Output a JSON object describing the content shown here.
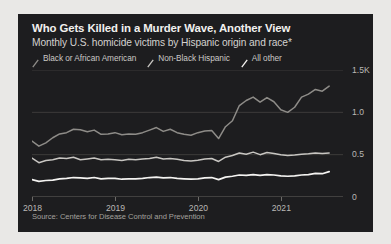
{
  "chart_panel": {
    "title": "Who Gets Killed in a Murder Wave, Another View",
    "subtitle": "Monthly U.S. homicide victims by Hispanic origin and race*",
    "source": "Source: Centers for Disease Control and Prevention",
    "background_color": "#1d1d1f",
    "page_background_color": "#e9e8e6"
  },
  "chart_data": {
    "type": "line",
    "title": "Who Gets Killed in a Murder Wave, Another View",
    "subtitle": "Monthly U.S. homicide victims by Hispanic origin and race*",
    "xlabel": "",
    "ylabel": "",
    "xlim": [
      2018.0,
      2021.75
    ],
    "ylim": [
      0,
      1500
    ],
    "grid": true,
    "legend_position": "top-left",
    "y_ticks": [
      0,
      500,
      1000,
      1500
    ],
    "y_tick_labels": [
      "0",
      "0.5",
      "1.0",
      "1.5K"
    ],
    "x_ticks": [
      2018,
      2019,
      2020,
      2021
    ],
    "x_tick_labels": [
      "2018",
      "2019",
      "2020",
      "2021"
    ],
    "x": [
      2018.0,
      2018.083,
      2018.167,
      2018.25,
      2018.333,
      2018.417,
      2018.5,
      2018.583,
      2018.667,
      2018.75,
      2018.833,
      2018.917,
      2019.0,
      2019.083,
      2019.167,
      2019.25,
      2019.333,
      2019.417,
      2019.5,
      2019.583,
      2019.667,
      2019.75,
      2019.833,
      2019.917,
      2020.0,
      2020.083,
      2020.167,
      2020.25,
      2020.333,
      2020.417,
      2020.5,
      2020.583,
      2020.667,
      2020.75,
      2020.833,
      2020.917,
      2021.0,
      2021.083,
      2021.167,
      2021.25,
      2021.333,
      2021.417,
      2021.5,
      2021.583
    ],
    "series": [
      {
        "name": "Black or African American",
        "color": "#8e8c88",
        "values": [
          660,
          600,
          640,
          700,
          745,
          760,
          800,
          795,
          770,
          790,
          740,
          745,
          760,
          735,
          745,
          740,
          760,
          790,
          820,
          775,
          800,
          760,
          740,
          730,
          760,
          780,
          785,
          690,
          830,
          900,
          1080,
          1140,
          1180,
          1120,
          1175,
          1125,
          1030,
          1000,
          1060,
          1180,
          1215,
          1270,
          1250,
          1310
        ]
      },
      {
        "name": "Non-Black Hispanic",
        "color": "#c8c6c2",
        "values": [
          460,
          405,
          430,
          440,
          460,
          455,
          470,
          440,
          450,
          460,
          440,
          445,
          440,
          430,
          445,
          440,
          450,
          455,
          470,
          450,
          455,
          445,
          430,
          425,
          435,
          450,
          455,
          420,
          470,
          490,
          520,
          505,
          530,
          500,
          525,
          515,
          500,
          490,
          495,
          505,
          510,
          520,
          515,
          520
        ]
      },
      {
        "name": "All other",
        "color": "#f4f3f1",
        "values": [
          205,
          185,
          195,
          200,
          215,
          220,
          230,
          225,
          220,
          230,
          215,
          220,
          220,
          210,
          215,
          215,
          220,
          230,
          235,
          225,
          230,
          220,
          215,
          210,
          215,
          225,
          230,
          205,
          235,
          245,
          260,
          255,
          265,
          255,
          265,
          260,
          250,
          245,
          250,
          260,
          265,
          280,
          275,
          300
        ]
      }
    ]
  }
}
